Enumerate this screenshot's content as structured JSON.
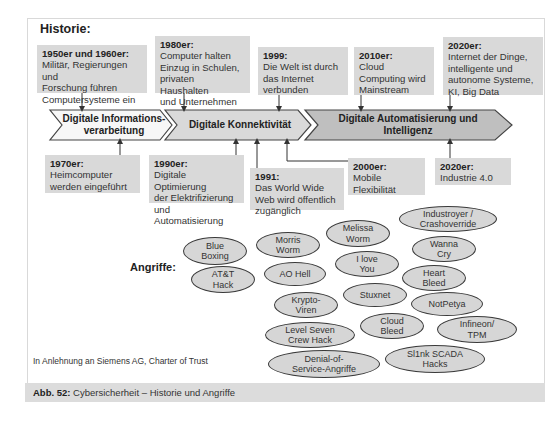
{
  "header": {
    "title": "Historie:"
  },
  "timeline": {
    "phases": [
      {
        "label_line1": "Digitale Informations-",
        "label_line2": "verarbeitung",
        "fill": "#f7f7f7"
      },
      {
        "label_line1": "Digitale Konnektivität",
        "label_line2": "",
        "fill": "#d9d9d9"
      },
      {
        "label_line1": "Digitale Automatisierung und",
        "label_line2": "Intelligenz",
        "fill": "#bfbfbf"
      }
    ],
    "top_events": [
      {
        "period": "1950er und 1960er:",
        "lines": [
          "Militär, Regierungen und",
          "Forschung führen",
          "Computersysteme ein"
        ]
      },
      {
        "period": "1980er:",
        "lines": [
          "Computer halten",
          "Einzug in Schulen,",
          "privaten Haushalten",
          "und  Unternehmen"
        ]
      },
      {
        "period": "1999:",
        "lines": [
          "Die Welt ist durch",
          "das Internet",
          "verbunden"
        ]
      },
      {
        "period": "2010er:",
        "lines": [
          "Cloud",
          "Computing wird",
          "Mainstream"
        ]
      },
      {
        "period": "2020er:",
        "lines": [
          "Internet der Dinge,",
          "intelligente und",
          "autonome Systeme,",
          "KI, Big Data"
        ]
      }
    ],
    "bottom_events": [
      {
        "period": "1970er:",
        "lines": [
          "Heimcomputer",
          "werden eingeführt"
        ]
      },
      {
        "period": "1990er:",
        "lines": [
          "Digitale Optimierung",
          "der Elektrifizierung",
          "und Automatisierung"
        ]
      },
      {
        "period": "1991:",
        "lines": [
          "Das World Wide",
          "Web wird öffentlich",
          "zugänglich"
        ]
      },
      {
        "period": "2000er:",
        "lines": [
          "Mobile",
          "Flexibilität"
        ]
      },
      {
        "period": "2020er:",
        "lines": [
          "Industrie 4.0"
        ]
      }
    ]
  },
  "attacks": {
    "label": "Angriffe:",
    "items": [
      {
        "line1": "Blue",
        "line2": "Boxing"
      },
      {
        "line1": "AT&T",
        "line2": "Hack"
      },
      {
        "line1": "Morris",
        "line2": "Worm"
      },
      {
        "line1": "AO Hell",
        "line2": ""
      },
      {
        "line1": "Melissa",
        "line2": "Worm"
      },
      {
        "line1": "I love",
        "line2": "You"
      },
      {
        "line1": "Krypto-",
        "line2": "Viren"
      },
      {
        "line1": "Stuxnet",
        "line2": ""
      },
      {
        "line1": "Level Seven",
        "line2": "Crew Hack"
      },
      {
        "line1": "Cloud",
        "line2": "Bleed"
      },
      {
        "line1": "Denial-of-",
        "line2": "Service-Angriffe"
      },
      {
        "line1": "Industroyer /",
        "line2": "Crashoverride"
      },
      {
        "line1": "Wanna",
        "line2": "Cry"
      },
      {
        "line1": "Heart",
        "line2": "Bleed"
      },
      {
        "line1": "NotPetya",
        "line2": ""
      },
      {
        "line1": "Infineon/",
        "line2": "TPM"
      },
      {
        "line1": "Sl1nk SCADA",
        "line2": "Hacks"
      }
    ]
  },
  "source": "In Anlehnung an Siemens AG, Charter of Trust",
  "caption": {
    "label": "Abb. 52:",
    "text": " Cybersicherheit – Historie und Angriffe"
  },
  "colors": {
    "box_fill": "#d9d9d9",
    "oval_fill": "#d6d6d6",
    "line": "#333333",
    "caption_bg": "#dcdcdc"
  }
}
